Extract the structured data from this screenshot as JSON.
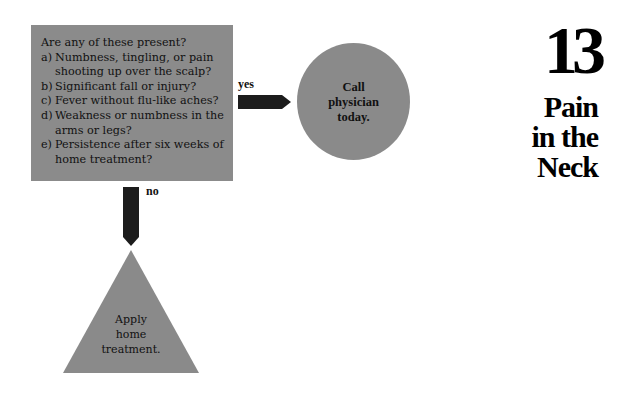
{
  "chapter": {
    "number": "13",
    "title_lines": [
      "Pain",
      "in the",
      "Neck"
    ]
  },
  "question_box": {
    "title": "Are any of these present?",
    "items": [
      {
        "letter": "a)",
        "text": "Numbness, tingling, or pain shooting up over the scalp?"
      },
      {
        "letter": "b)",
        "text": "Significant fall or injury?"
      },
      {
        "letter": "c)",
        "text": "Fever without flu-like aches?"
      },
      {
        "letter": "d)",
        "text": "Weakness or numbness in the arms or legs?"
      },
      {
        "letter": "e)",
        "text": "Persistence after six weeks of home treatment?"
      }
    ]
  },
  "branches": {
    "yes": {
      "label": "yes",
      "outcome_lines": [
        "Call",
        "physician",
        "today."
      ]
    },
    "no": {
      "label": "no",
      "outcome_lines": [
        "Apply",
        "home",
        "treatment."
      ]
    }
  },
  "colors": {
    "shape_fill": "#8b8b8b",
    "arrow_fill": "#1c1c1c",
    "text": "#111111"
  }
}
